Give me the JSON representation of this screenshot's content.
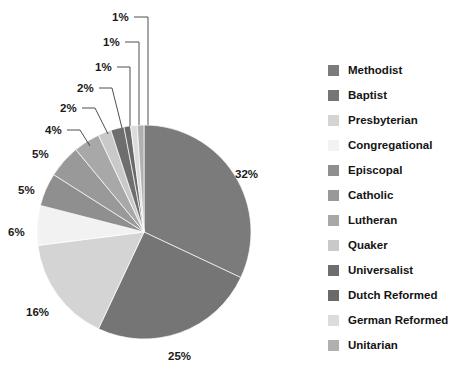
{
  "chart_data": {
    "type": "pie",
    "title": "",
    "subtitle": "",
    "xlabel": "",
    "ylabel": "",
    "legend_position": "right",
    "grid": false,
    "start_angle_deg": 0,
    "direction": "clockwise",
    "categories": [
      "Methodist",
      "Baptist",
      "Presbyterian",
      "Congregational",
      "Episcopal",
      "Catholic",
      "Lutheran",
      "Quaker",
      "Universalist",
      "Dutch Reformed",
      "German Reformed",
      "Unitarian"
    ],
    "values": [
      32,
      25,
      16,
      6,
      5,
      5,
      4,
      2,
      2,
      1,
      1,
      1
    ],
    "data_labels": [
      "32%",
      "25%",
      "16%",
      "6%",
      "5%",
      "5%",
      "4%",
      "2%",
      "2%",
      "1%",
      "1%",
      "1%"
    ],
    "colors": [
      "#7b7b7b",
      "#757575",
      "#d4d4d4",
      "#f2f2f2",
      "#8f8f8f",
      "#999999",
      "#a8a8a8",
      "#c9c9c9",
      "#6e6e6e",
      "#6a6a6a",
      "#dcdcdc",
      "#b0b0b0"
    ]
  },
  "legend": {
    "items": [
      {
        "label": "Methodist",
        "color": "#7b7b7b"
      },
      {
        "label": "Baptist",
        "color": "#757575"
      },
      {
        "label": "Presbyterian",
        "color": "#d4d4d4"
      },
      {
        "label": "Congregational",
        "color": "#f2f2f2"
      },
      {
        "label": "Episcopal",
        "color": "#8f8f8f"
      },
      {
        "label": "Catholic",
        "color": "#999999"
      },
      {
        "label": "Lutheran",
        "color": "#a8a8a8"
      },
      {
        "label": "Quaker",
        "color": "#c9c9c9"
      },
      {
        "label": "Universalist",
        "color": "#6e6e6e"
      },
      {
        "label": "Dutch Reformed",
        "color": "#6a6a6a"
      },
      {
        "label": "German Reformed",
        "color": "#dcdcdc"
      },
      {
        "label": "Unitarian",
        "color": "#b0b0b0"
      }
    ]
  },
  "pie_labels": [
    {
      "text": "32%",
      "x": 235,
      "y": 178
    },
    {
      "text": "25%",
      "x": 168,
      "y": 360
    },
    {
      "text": "16%",
      "x": 26,
      "y": 316
    },
    {
      "text": "6%",
      "x": 8,
      "y": 236
    },
    {
      "text": "5%",
      "x": 18,
      "y": 194
    },
    {
      "text": "5%",
      "x": 32,
      "y": 158
    },
    {
      "text": "4%",
      "x": 45,
      "y": 134
    },
    {
      "text": "2%",
      "x": 60,
      "y": 112
    },
    {
      "text": "2%",
      "x": 77,
      "y": 92
    },
    {
      "text": "1%",
      "x": 95,
      "y": 71
    },
    {
      "text": "1%",
      "x": 103,
      "y": 46
    },
    {
      "text": "1%",
      "x": 112,
      "y": 21
    }
  ]
}
